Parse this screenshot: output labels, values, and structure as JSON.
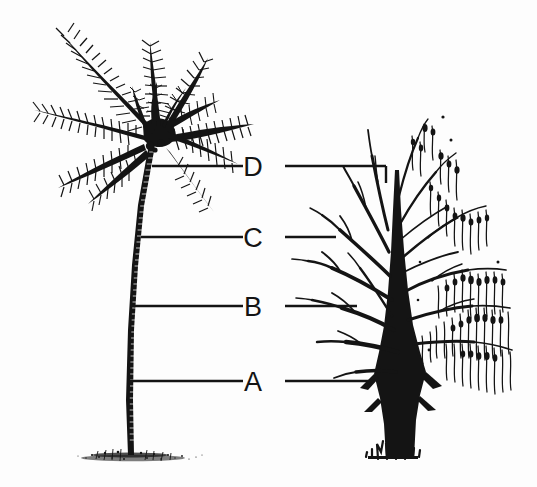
{
  "figure": {
    "background_color": "#fdfdfd",
    "ink_color": "#141414",
    "width": 537,
    "height": 487
  },
  "labels": [
    {
      "id": "D",
      "text": "D",
      "y": 166,
      "left_line_x1": 152,
      "left_line_x2": 243,
      "right_line_x1": 285,
      "right_line_x2": 385,
      "right_drop_to_y": 182
    },
    {
      "id": "C",
      "text": "C",
      "y": 237,
      "left_line_x1": 141,
      "left_line_x2": 243,
      "right_line_x1": 285,
      "right_line_x2": 334,
      "right_drop_to_y": 237
    },
    {
      "id": "B",
      "text": "B",
      "y": 306,
      "left_line_x1": 134,
      "left_line_x2": 243,
      "right_line_x1": 285,
      "right_line_x2": 355,
      "right_drop_to_y": 306
    },
    {
      "id": "A",
      "text": "A",
      "y": 381,
      "left_line_x1": 129,
      "left_line_x2": 243,
      "right_line_x1": 285,
      "right_line_x2": 370,
      "right_drop_to_y": 381
    }
  ],
  "left_subject": {
    "name": "palm-tree",
    "description": "Coconut palm with radiating fronds, slender ringed trunk curving slightly, stippled ground at base"
  },
  "right_subject": {
    "name": "willow-tree",
    "description": "Willow with thick dark trunk, bare ascending branches on left half and drooping leafy catkins on right half, grass tufts at base"
  }
}
